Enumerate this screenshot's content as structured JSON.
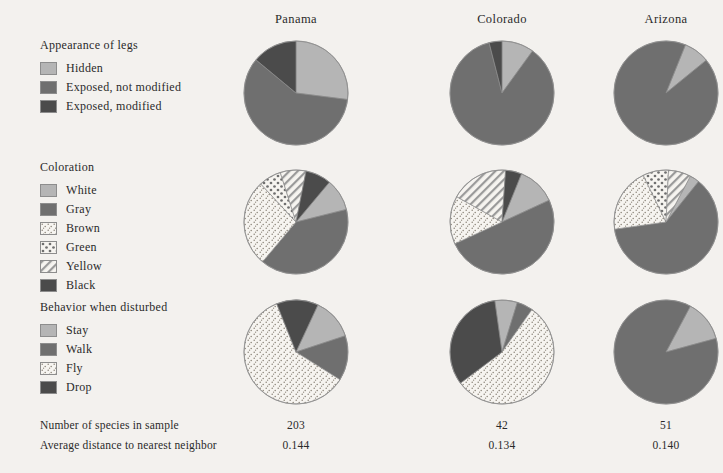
{
  "columns": [
    {
      "name": "Panama",
      "cx": 296,
      "header_left": 216
    },
    {
      "name": "Colorado",
      "cx": 502,
      "header_left": 422
    },
    {
      "name": "Arizona",
      "cx": 666,
      "header_left": 586
    }
  ],
  "palette": {
    "light_gray": "#b5b5b5",
    "medium_gray": "#6f6f6f",
    "dark_gray": "#4b4b4b",
    "white_fill": "#b5b5b5",
    "brown_stipple_bg": "#f6f4f0",
    "brown_stipple_dot": "#8a8378",
    "green_dot_bg": "#f6f4f0",
    "green_dot_fg": "#6f6f6f",
    "yellow_hatch_bg": "#f6f4f0",
    "yellow_hatch_fg": "#8d8d8d",
    "outline": "#8d8d8d",
    "background": "#f3f1ee",
    "text": "#2a2a2a"
  },
  "legends": [
    {
      "id": "appearance-of-legs",
      "title": "Appearance of legs",
      "top": 38,
      "items": [
        {
          "label": "Hidden",
          "fill": "light_gray",
          "pattern": "solid"
        },
        {
          "label": "Exposed, not modified",
          "fill": "medium_gray",
          "pattern": "solid"
        },
        {
          "label": "Exposed, modified",
          "fill": "dark_gray",
          "pattern": "solid"
        }
      ]
    },
    {
      "id": "coloration",
      "title": "Coloration",
      "top": 160,
      "items": [
        {
          "label": "White",
          "fill": "light_gray",
          "pattern": "solid"
        },
        {
          "label": "Gray",
          "fill": "medium_gray",
          "pattern": "solid"
        },
        {
          "label": "Brown",
          "fill": "none",
          "pattern": "stipple"
        },
        {
          "label": "Green",
          "fill": "none",
          "pattern": "dots"
        },
        {
          "label": "Yellow",
          "fill": "none",
          "pattern": "hatch"
        },
        {
          "label": "Black",
          "fill": "dark_gray",
          "pattern": "solid"
        }
      ]
    },
    {
      "id": "behavior-when-disturbed",
      "title": "Behavior when disturbed",
      "top": 300,
      "items": [
        {
          "label": "Stay",
          "fill": "light_gray",
          "pattern": "solid"
        },
        {
          "label": "Walk",
          "fill": "medium_gray",
          "pattern": "solid"
        },
        {
          "label": "Fly",
          "fill": "none",
          "pattern": "stipple"
        },
        {
          "label": "Drop",
          "fill": "dark_gray",
          "pattern": "solid"
        }
      ]
    }
  ],
  "stats": [
    {
      "label": "Number of species in sample",
      "values": [
        "203",
        "42",
        "51"
      ]
    },
    {
      "label": "Average distance to nearest neighbor",
      "values": [
        "0.144",
        "0.134",
        "0.140"
      ]
    }
  ],
  "chart_data": {
    "type": "pie",
    "grid": false,
    "legend_position": "left",
    "columns": [
      "Panama",
      "Colorado",
      "Arizona"
    ],
    "rows": [
      {
        "name": "Appearance of legs",
        "categories": [
          "Hidden",
          "Exposed, not modified",
          "Exposed, modified"
        ],
        "cy": 93,
        "radius": 52,
        "series": [
          {
            "name": "Panama",
            "values": [
              27,
              59,
              14
            ],
            "start_angle": -90
          },
          {
            "name": "Colorado",
            "values": [
              10,
              86,
              4
            ],
            "start_angle": -90
          },
          {
            "name": "Arizona",
            "values": [
              8,
              92,
              0
            ],
            "start_angle": -68
          }
        ]
      },
      {
        "name": "Coloration",
        "categories": [
          "White",
          "Gray",
          "Brown",
          "Green",
          "Yellow",
          "Black"
        ],
        "cy": 222,
        "radius": 52,
        "series": [
          {
            "name": "Panama",
            "values": [
              10,
              40,
              27,
              7,
              8,
              8
            ],
            "start_angle": -50
          },
          {
            "name": "Colorado",
            "values": [
              12,
              50,
              15,
              0,
              18,
              5
            ],
            "start_angle": -68
          },
          {
            "name": "Arizona",
            "values": [
              3,
              62,
              20,
              8,
              7,
              0
            ],
            "start_angle": -62
          }
        ]
      },
      {
        "name": "Behavior when disturbed",
        "categories": [
          "Stay",
          "Walk",
          "Fly",
          "Drop"
        ],
        "cy": 352,
        "radius": 52,
        "series": [
          {
            "name": "Panama",
            "values": [
              13,
              14,
              60,
              13
            ],
            "start_angle": -65
          },
          {
            "name": "Colorado",
            "values": [
              7,
              5,
              55,
              33
            ],
            "start_angle": -98
          },
          {
            "name": "Arizona",
            "values": [
              13,
              87,
              0,
              0
            ],
            "start_angle": -62
          }
        ]
      }
    ],
    "category_styles": {
      "Hidden": {
        "fill": "light_gray",
        "pattern": "solid"
      },
      "Exposed, not modified": {
        "fill": "medium_gray",
        "pattern": "solid"
      },
      "Exposed, modified": {
        "fill": "dark_gray",
        "pattern": "solid"
      },
      "White": {
        "fill": "light_gray",
        "pattern": "solid"
      },
      "Gray": {
        "fill": "medium_gray",
        "pattern": "solid"
      },
      "Brown": {
        "fill": "none",
        "pattern": "stipple"
      },
      "Green": {
        "fill": "none",
        "pattern": "dots"
      },
      "Yellow": {
        "fill": "none",
        "pattern": "hatch"
      },
      "Black": {
        "fill": "dark_gray",
        "pattern": "solid"
      },
      "Stay": {
        "fill": "light_gray",
        "pattern": "solid"
      },
      "Walk": {
        "fill": "medium_gray",
        "pattern": "solid"
      },
      "Fly": {
        "fill": "none",
        "pattern": "stipple"
      },
      "Drop": {
        "fill": "dark_gray",
        "pattern": "solid"
      }
    }
  }
}
